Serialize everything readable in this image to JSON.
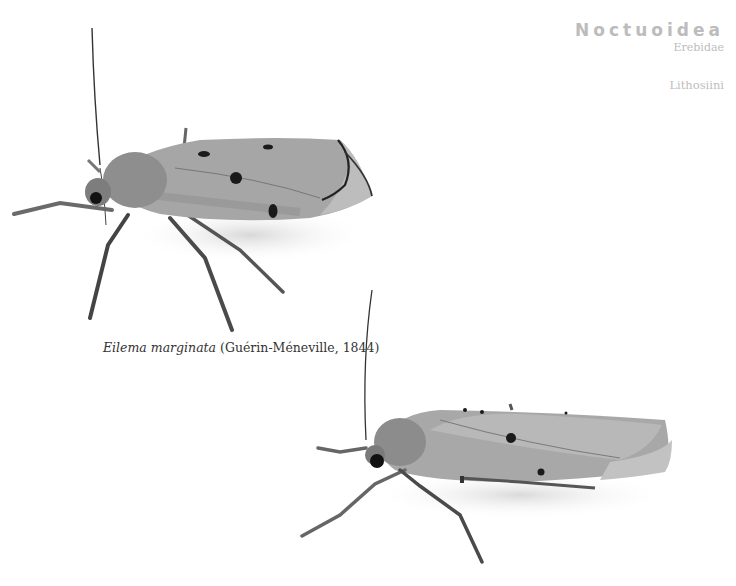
{
  "taxonomy": {
    "superfamily": "Noctuoidea",
    "family": "Erebidae",
    "tribe": "Lithosiini"
  },
  "specimen": {
    "genus_species": "Eilema marginata",
    "authority": "(Guérin-Méneville, 1844)"
  },
  "figures": [
    {
      "name": "moth-specimen-upper",
      "view": "lateral, wings folded, antenna raised"
    },
    {
      "name": "moth-specimen-lower",
      "view": "lateral, wings folded, antenna raised"
    }
  ],
  "colors": {
    "background": "#ffffff",
    "heading_text": "#bcbcbc",
    "caption_text": "#333333",
    "wing": "#9a9a9a",
    "wing_light": "#b0b0b0",
    "body_dark": "#555555",
    "spot": "#1a1a1a"
  }
}
